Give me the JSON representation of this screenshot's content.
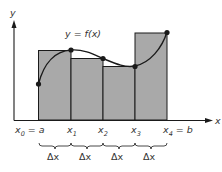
{
  "diagram": {
    "type": "riemann-sum-upper",
    "colors": {
      "bar_fill": "#a9a9a9",
      "stroke": "#1a1a1a",
      "text": "#333333",
      "background": "#ffffff"
    },
    "axes": {
      "x_label": "x",
      "y_label": "y"
    },
    "curve_label": "y = f(x)",
    "partition_labels": [
      {
        "main": "x",
        "sub": "0",
        "suffix": " = a"
      },
      {
        "main": "x",
        "sub": "1",
        "suffix": ""
      },
      {
        "main": "x",
        "sub": "2",
        "suffix": ""
      },
      {
        "main": "x",
        "sub": "3",
        "suffix": ""
      },
      {
        "main": "x",
        "sub": "4",
        "suffix": " = b"
      }
    ],
    "interval_labels": [
      "Δx",
      "Δx",
      "Δx",
      "Δx"
    ],
    "rectangles": [
      {
        "x_from": "x0",
        "x_to": "x1",
        "height_at": "x1"
      },
      {
        "x_from": "x1",
        "x_to": "x2",
        "height_at": "x2"
      },
      {
        "x_from": "x2",
        "x_to": "x3",
        "height_at": "x3"
      },
      {
        "x_from": "x3",
        "x_to": "x4",
        "height_at": "x4"
      }
    ],
    "points": [
      "f(x0)",
      "f(x1)",
      "f(x2)",
      "f(x3)",
      "f(x4)"
    ]
  }
}
